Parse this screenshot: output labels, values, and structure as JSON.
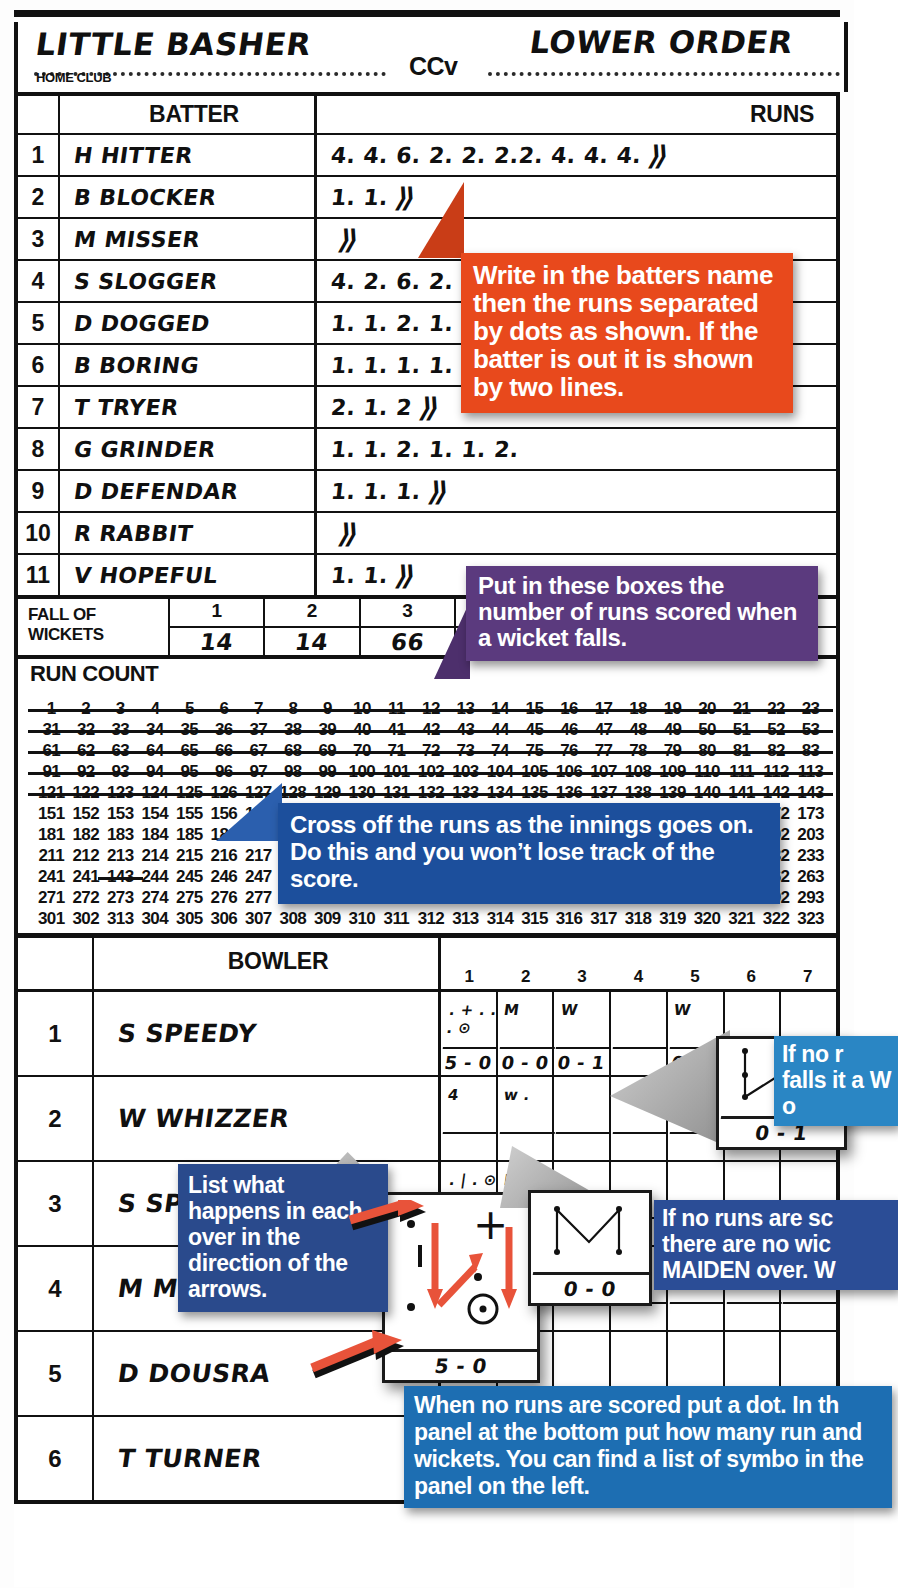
{
  "header": {
    "home_team": "LITTLE BASHER",
    "home_label": "HOME CLUB",
    "versus": "CCv",
    "away_team": "LOWER ORDER"
  },
  "batting": {
    "col_no": "",
    "col_batter": "BATTER",
    "col_runs": "RUNS",
    "out_mark": "⟫",
    "rows": [
      {
        "no": "1",
        "name": "H HITTER",
        "runs": "4. 4. 6. 2. 2. 2.2. 4. 4. 4.",
        "out": true
      },
      {
        "no": "2",
        "name": "B BLOCKER",
        "runs": "1. 1.",
        "out": true
      },
      {
        "no": "3",
        "name": "M MISSER",
        "runs": "",
        "out": true
      },
      {
        "no": "4",
        "name": "S SLOGGER",
        "runs": "4. 2. 6. 2.",
        "out": false
      },
      {
        "no": "5",
        "name": "D DOGGED",
        "runs": "1. 1. 2. 1. 3.",
        "out": false
      },
      {
        "no": "6",
        "name": "B BORING",
        "runs": "1. 1. 1. 1. 1. 1.",
        "out": false
      },
      {
        "no": "7",
        "name": "T TRYER",
        "runs": "2. 1. 2",
        "out": true
      },
      {
        "no": "8",
        "name": "G GRINDER",
        "runs": "1. 1. 2. 1. 1. 2.",
        "out": false
      },
      {
        "no": "9",
        "name": "D DEFENDAR",
        "runs": "1. 1. 1.",
        "out": true
      },
      {
        "no": "10",
        "name": "R RABBIT",
        "runs": "",
        "out": true
      },
      {
        "no": "11",
        "name": "V HOPEFUL",
        "runs": "1. 1.",
        "out": true
      }
    ]
  },
  "fall_of_wickets": {
    "label_line1": "FALL OF",
    "label_line2": "WICKETS",
    "columns": [
      "1",
      "2",
      "3",
      "4",
      "5",
      "6",
      "7"
    ],
    "values": [
      "14",
      "14",
      "66",
      "80",
      "14",
      "102",
      "124"
    ]
  },
  "run_count": {
    "title": "RUN COUNT",
    "per_row": 23,
    "row_starts": [
      1,
      31,
      61,
      91,
      121,
      151,
      181,
      211,
      241,
      271,
      301
    ],
    "rows": [
      [
        "1",
        "2",
        "3",
        "4",
        "5",
        "6",
        "7",
        "8",
        "9",
        "10",
        "11",
        "12",
        "13",
        "14",
        "15",
        "16",
        "17",
        "18",
        "19",
        "20",
        "21",
        "22",
        "23"
      ],
      [
        "31",
        "32",
        "33",
        "34",
        "35",
        "36",
        "37",
        "38",
        "39",
        "40",
        "41",
        "42",
        "43",
        "44",
        "45",
        "46",
        "47",
        "48",
        "49",
        "50",
        "51",
        "52",
        "53"
      ],
      [
        "61",
        "62",
        "63",
        "64",
        "65",
        "66",
        "67",
        "68",
        "69",
        "70",
        "71",
        "72",
        "73",
        "74",
        "75",
        "76",
        "77",
        "78",
        "79",
        "80",
        "81",
        "82",
        "83"
      ],
      [
        "91",
        "92",
        "93",
        "94",
        "95",
        "96",
        "97",
        "98",
        "99",
        "100",
        "101",
        "102",
        "103",
        "104",
        "105",
        "106",
        "107",
        "108",
        "109",
        "110",
        "111",
        "112",
        "113"
      ],
      [
        "121",
        "122",
        "123",
        "124",
        "125",
        "126",
        "127",
        "128",
        "129",
        "130",
        "131",
        "132",
        "133",
        "134",
        "135",
        "136",
        "137",
        "138",
        "139",
        "140",
        "141",
        "142",
        "143"
      ],
      [
        "151",
        "152",
        "153",
        "154",
        "155",
        "156",
        "157",
        "158",
        "159",
        "160",
        "161",
        "162",
        "163",
        "164",
        "165",
        "166",
        "167",
        "168",
        "169",
        "170",
        "171",
        "172",
        "173"
      ],
      [
        "181",
        "182",
        "183",
        "184",
        "185",
        "186",
        "187",
        "188",
        "189",
        "190",
        "191",
        "192",
        "193",
        "194",
        "195",
        "196",
        "197",
        "198",
        "199",
        "200",
        "201",
        "202",
        "203"
      ],
      [
        "211",
        "212",
        "213",
        "214",
        "215",
        "216",
        "217",
        "218",
        "219",
        "220",
        "221",
        "222",
        "223",
        "224",
        "225",
        "226",
        "227",
        "228",
        "229",
        "230",
        "231",
        "232",
        "233"
      ],
      [
        "241",
        "241",
        "143",
        "244",
        "245",
        "246",
        "247",
        "248",
        "249",
        "250",
        "251",
        "252",
        "253",
        "254",
        "255",
        "256",
        "257",
        "258",
        "259",
        "260",
        "261",
        "262",
        "263"
      ],
      [
        "271",
        "272",
        "273",
        "274",
        "275",
        "276",
        "277",
        "278",
        "279",
        "280",
        "281",
        "282",
        "283",
        "284",
        "285",
        "286",
        "287",
        "288",
        "289",
        "290",
        "291",
        "292",
        "293"
      ],
      [
        "301",
        "302",
        "313",
        "304",
        "305",
        "306",
        "307",
        "308",
        "309",
        "310",
        "311",
        "312",
        "313",
        "314",
        "315",
        "316",
        "317",
        "318",
        "319",
        "320",
        "321",
        "322",
        "323"
      ]
    ],
    "struck_through_count": 143
  },
  "bowling": {
    "col_bowler": "BOWLER",
    "over_numbers": [
      "1",
      "2",
      "3",
      "4",
      "5",
      "6",
      "7"
    ],
    "rows": [
      {
        "no": "1",
        "name": "S SPEEDY",
        "overs": [
          {
            "balls": ". + . . . ⊙",
            "score": "5 - 0"
          },
          {
            "balls": "M",
            "score": "0 - 0"
          },
          {
            "balls": "W",
            "score": "0 - 1"
          },
          {
            "balls": "",
            "score": ""
          },
          {
            "balls": "W",
            "score": "0 - 1"
          },
          {
            "balls": "",
            "score": ""
          },
          {
            "balls": "",
            "score": ""
          }
        ]
      },
      {
        "no": "2",
        "name": "W WHIZZER",
        "overs": [
          {
            "balls": "4",
            "score": ""
          },
          {
            "balls": "w .",
            "score": ""
          },
          {
            "balls": "",
            "score": ""
          },
          {
            "balls": "",
            "score": ""
          },
          {
            "balls": "",
            "score": ""
          },
          {
            "balls": "",
            "score": ""
          },
          {
            "balls": "",
            "score": ""
          }
        ]
      },
      {
        "no": "3",
        "name": "S SPINNER",
        "overs": [
          {
            "balls": ". | . ⊙ +",
            "score": "5 - 0"
          },
          {
            "balls": "M",
            "score": "0 - 0"
          },
          {
            "balls": "",
            "score": ""
          },
          {
            "balls": "",
            "score": ""
          },
          {
            "balls": "",
            "score": ""
          },
          {
            "balls": "",
            "score": ""
          },
          {
            "balls": "",
            "score": ""
          }
        ]
      },
      {
        "no": "4",
        "name": "M MEDEAM",
        "overs": [
          {
            "balls": "5 - 0",
            "score": ""
          },
          {
            "balls": "M",
            "score": ""
          },
          {
            "balls": "2 △ 1 w",
            "score": ""
          },
          {
            "balls": "",
            "score": ""
          },
          {
            "balls": "",
            "score": ""
          },
          {
            "balls": "",
            "score": ""
          },
          {
            "balls": "",
            "score": ""
          }
        ]
      },
      {
        "no": "5",
        "name": "D DOUSRA",
        "overs": [
          {
            "balls": "",
            "score": ""
          },
          {
            "balls": "",
            "score": ""
          },
          {
            "balls": "",
            "score": ""
          },
          {
            "balls": "",
            "score": ""
          },
          {
            "balls": "",
            "score": ""
          },
          {
            "balls": "",
            "score": ""
          },
          {
            "balls": "",
            "score": ""
          }
        ]
      },
      {
        "no": "6",
        "name": "T TURNER",
        "overs": [
          {
            "balls": ". .",
            "score": "7 - 0"
          },
          {
            "balls": ". 1",
            "score": "3 - 0"
          },
          {
            "balls": "▽ 2",
            "score": "5 - 1"
          },
          {
            "balls": "",
            "score": ""
          },
          {
            "balls": "",
            "score": ""
          },
          {
            "balls": "",
            "score": ""
          },
          {
            "balls": "",
            "score": ""
          }
        ]
      }
    ]
  },
  "callouts": {
    "orange": "Write in the batters name then the runs separated by dots as shown. If the batter is out it is shown by two lines.",
    "purple": "Put in these boxes the number of runs scored when a wicket falls.",
    "blue_runcount": "Cross off the runs as the innings goes on. Do this and you won’t lose track of the score.",
    "blue_right_top": "If no r falls it a W o",
    "blue_right_mid": "If no runs are sc there are no wic MAIDEN over. W",
    "navy_arrows": "List what happens in each over in the direction of the arrows.",
    "blue_bottom": "When no runs are scored put a dot. In th panel at the bottom put how many run and wickets. You can find a list of symbo in the panel on the left."
  },
  "popouts": {
    "over_a_score": "0 - 1",
    "over_b_score": "5 - 0",
    "over_c_score": "0 - 0"
  },
  "colors": {
    "orange": "#e8491c",
    "purple": "#5b3a7e",
    "blue_dark": "#1c4f9c",
    "blue_light": "#2a86c4",
    "navy": "#2a4a8c",
    "arrow_red": "#e8533a",
    "ink": "#111111"
  }
}
